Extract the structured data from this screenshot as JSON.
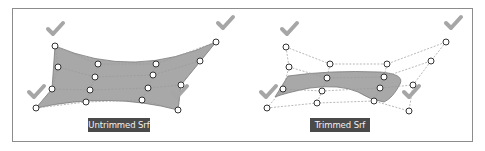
{
  "figure": {
    "frame": {
      "x": 12,
      "y": 8,
      "width": 460,
      "height": 133,
      "stroke": "#8c8c8c"
    },
    "colors": {
      "surface_fill": "#a8a8a8",
      "surface_edge": "#7a7a7a",
      "control_polygon": "#9a9a9a",
      "control_point_fill": "#ffffff",
      "control_point_stroke": "#333333",
      "checkmark": "#a6a6a6",
      "label_bg": "#4a4a4a",
      "label_text": "#f2f2f2"
    },
    "panels": [
      {
        "id": "untrimmed",
        "label": "Untrimmed Srf",
        "label_box": {
          "x": 88,
          "y": 118,
          "w": 62
        },
        "checkmarks": [
          [
            55,
            30
          ],
          [
            225,
            24
          ],
          [
            36,
            93
          ],
          [
            179,
            93
          ]
        ],
        "control_rows": [
          [
            [
              55,
              46
            ],
            [
              98,
              64
            ],
            [
              156,
              64
            ],
            [
              216,
              42
            ]
          ],
          [
            [
              58,
              67
            ],
            [
              95,
              77
            ],
            [
              153,
              75
            ],
            [
              200,
              61
            ]
          ],
          [
            [
              52,
              89
            ],
            [
              90,
              90
            ],
            [
              148,
              88
            ],
            [
              181,
              85
            ]
          ],
          [
            [
              36,
              108
            ],
            [
              86,
              102
            ],
            [
              142,
              100
            ],
            [
              178,
              110
            ]
          ]
        ],
        "surface_path": "M55,46 Q135,80 216,42 L181,85 L178,110 Q110,92 36,108 L52,89 Z"
      },
      {
        "id": "trimmed",
        "label": "Trimmed Srf",
        "label_box": {
          "x": 310,
          "y": 118,
          "w": 60
        },
        "checkmarks": [
          [
            289,
            30
          ],
          [
            453,
            24
          ],
          [
            268,
            93
          ],
          [
            411,
            93
          ]
        ],
        "control_rows": [
          [
            [
              286,
              47
            ],
            [
              330,
              64
            ],
            [
              387,
              64
            ],
            [
              446,
              42
            ]
          ],
          [
            [
              289,
              67
            ],
            [
              327,
              78
            ],
            [
              384,
              77
            ],
            [
              431,
              61
            ]
          ],
          [
            [
              283,
              89
            ],
            [
              322,
              91
            ],
            [
              380,
              88
            ],
            [
              413,
              85
            ]
          ],
          [
            [
              267,
              108
            ],
            [
              317,
              103
            ],
            [
              374,
              101
            ],
            [
              409,
              111
            ]
          ]
        ],
        "surface_path": "M288,76 Q330,70 380,72 Q405,74 400,84 Q393,98 384,102 Q370,100 358,92 Q340,84 310,88 Q285,93 275,97 Z"
      }
    ]
  }
}
